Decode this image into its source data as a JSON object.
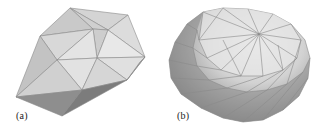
{
  "figure": {
    "panels": [
      {
        "id": "a",
        "label": "(a)",
        "description": "coarse triangulated convex polyhedron"
      },
      {
        "id": "b",
        "label": "(b)",
        "description": "refined triangulated ellipsoid-like polyhedron"
      }
    ],
    "colors": {
      "background": "#ffffff",
      "face_light": "#e6e6e6",
      "face_mid": "#c8c8c8",
      "face_dark": "#8f8f8f",
      "face_darkest": "#7a7a7a",
      "edge": "#8a8a8a",
      "label_text": "#222222"
    }
  }
}
